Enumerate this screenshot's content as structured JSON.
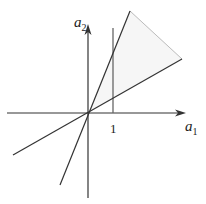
{
  "diagram": {
    "type": "cone-in-plane",
    "axes": {
      "x_label": "a",
      "x_subscript": "1",
      "y_label": "a",
      "y_subscript": "2",
      "tick_label": "1"
    },
    "elements": [
      {
        "name": "horizontal-axis",
        "description": "a1 axis with arrow"
      },
      {
        "name": "vertical-axis",
        "description": "a2 axis with arrow"
      },
      {
        "name": "steep-ray-line",
        "description": "line through origin, steep slope"
      },
      {
        "name": "shallow-ray-line",
        "description": "line through origin, shallow slope"
      },
      {
        "name": "vertical-line-a1-equals-1",
        "description": "vertical line at a1 = 1"
      },
      {
        "name": "shaded-cone-region",
        "description": "lightly shaded region between rays, closed by gray edge"
      }
    ],
    "colors": {
      "line": "#333333",
      "vertical_line": "#666666",
      "cone_edge": "#bbbbbb",
      "fill": "#f6f6f6"
    }
  }
}
